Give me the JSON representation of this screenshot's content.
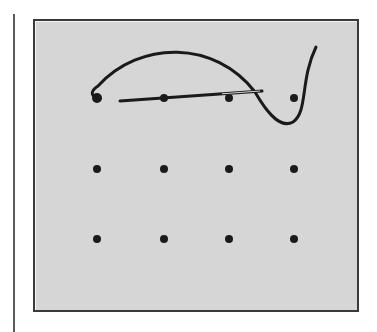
{
  "figure": {
    "colors": {
      "panel": "#d6d6d6",
      "border": "#3a3a3a",
      "ink": "#1a1a1a",
      "margin_rule": "#5a5a5a"
    },
    "grid": {
      "columns": [
        97,
        164,
        229,
        294
      ],
      "rows": [
        98,
        169,
        239
      ],
      "dot_radius": 4
    },
    "thread_path": "M 100 99 C 88 96, 92 90, 98 86 C 140 40, 215 40, 255 92 C 270 118, 282 128, 293 122 C 308 112, 300 80, 316 47",
    "needle": {
      "x1": 120,
      "y1": 101,
      "x2": 262,
      "y2": 91
    }
  }
}
